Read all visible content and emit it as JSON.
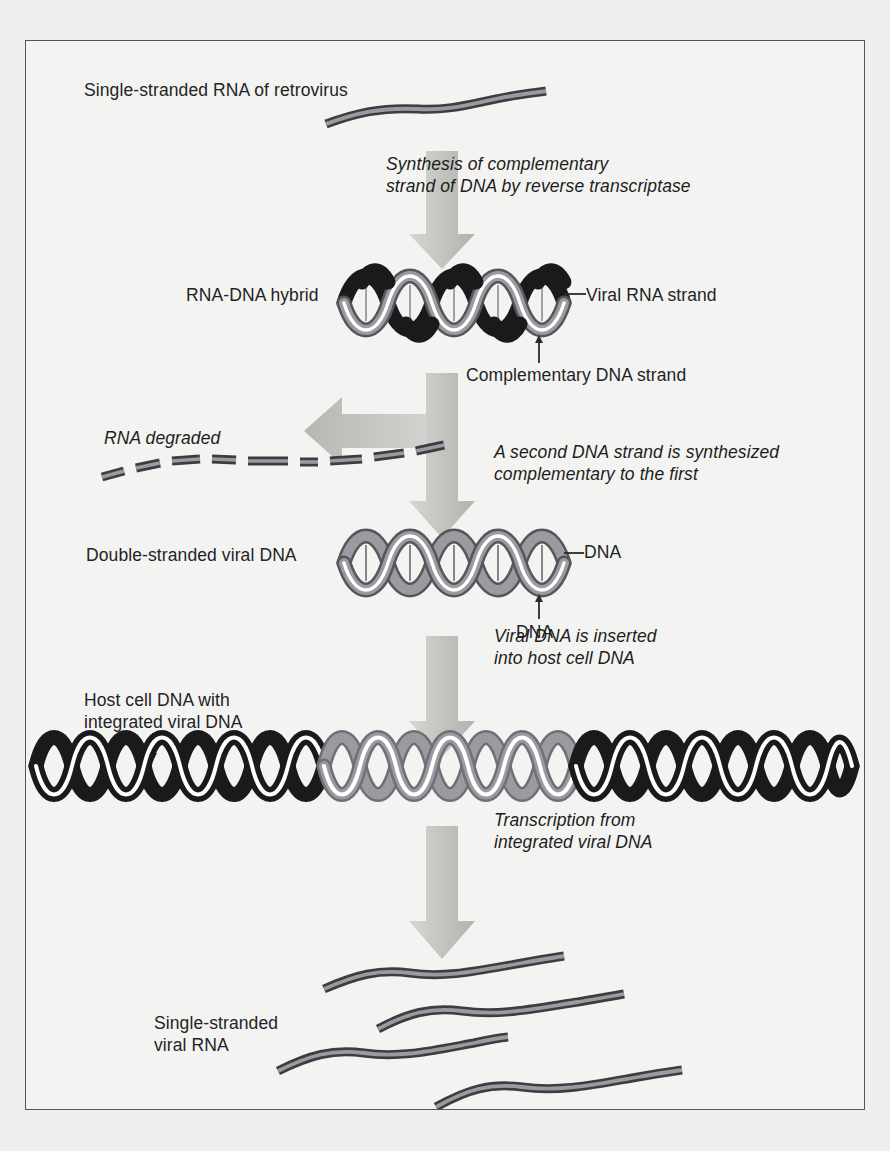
{
  "figure": {
    "background_color": "#f3f3f1",
    "border_color": "#55555a",
    "page_background": "#eeeeec"
  },
  "palette": {
    "rna_gray": "#7a7a80",
    "rna_gray_dark": "#4d4d52",
    "dna_gray": "#8b8b90",
    "dna_black": "#1a1a1c",
    "arrow_gray": "#c2c2c0",
    "arrow_gray_dark": "#a9a9a6",
    "text": "#232326",
    "leader_line": "#2a2a2d"
  },
  "labels": {
    "ss_rna_retrovirus": "Single-stranded RNA of retrovirus",
    "rna_dna_hybrid": "RNA-DNA hybrid",
    "viral_rna_strand": "Viral RNA strand",
    "complementary_dna_strand": "Complementary DNA strand",
    "rna_degraded": "RNA degraded",
    "double_stranded_viral_dna": "Double-stranded viral DNA",
    "dna_top": "DNA",
    "dna_bottom": "DNA",
    "host_cell_dna_line1": "Host cell DNA with",
    "host_cell_dna_line2": "integrated viral DNA",
    "ss_viral_rna_line1": "Single-stranded",
    "ss_viral_rna_line2": "viral RNA"
  },
  "steps": [
    {
      "id": "reverse-transcription",
      "line1": "Synthesis of complementary",
      "line2": "strand of DNA by reverse transcriptase"
    },
    {
      "id": "second-dna-strand",
      "line1": "A second DNA strand is synthesized",
      "line2": "complementary to the first"
    },
    {
      "id": "integration",
      "line1": "Viral DNA is inserted",
      "line2": "into host cell DNA"
    },
    {
      "id": "transcription",
      "line1": "Transcription from",
      "line2": "integrated viral DNA"
    }
  ],
  "diagram_elements": {
    "helix_hybrid": {
      "strand_a_color": "#8b8b90",
      "strand_b_color": "#1a1a1c",
      "turns": 6
    },
    "helix_viral_dna": {
      "strand_a_color": "#8b8b90",
      "strand_b_color": "#8b8b90",
      "turns": 6
    },
    "helix_integrated": {
      "segments": [
        "host-black",
        "viral-gray",
        "host-black"
      ],
      "host_color": "#1a1a1c",
      "viral_color": "#8b8b90",
      "turns": 21
    },
    "degraded_rna_fragments": 9,
    "viral_rna_strands": 4
  }
}
